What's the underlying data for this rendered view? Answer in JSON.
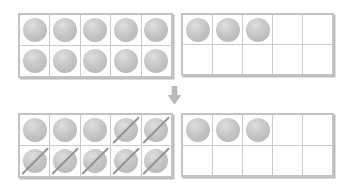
{
  "colors": {
    "background": "#ffffff",
    "frame_border": "#c3c3c3",
    "frame_shadow": "#bcbcbc",
    "grid_line": "#cbcbcb",
    "counter_main": "#c5c5c5",
    "counter_highlight": "#dedede",
    "counter_edge": "#b2b2b2",
    "slash": "#949494",
    "arrow": "#b9b9b9"
  },
  "arrow": {
    "icon": "down-block-arrow",
    "direction": "down"
  },
  "frames": [
    {
      "id": "top-left",
      "rows": 2,
      "cols": 5,
      "counter_count": 10,
      "filled_cells": [
        0,
        1,
        2,
        3,
        4,
        5,
        6,
        7,
        8,
        9
      ],
      "crossed_cells": [],
      "crossed_count": 0
    },
    {
      "id": "top-right",
      "rows": 2,
      "cols": 5,
      "counter_count": 3,
      "filled_cells": [
        0,
        1,
        2
      ],
      "crossed_cells": [],
      "crossed_count": 0
    },
    {
      "id": "bottom-left",
      "rows": 2,
      "cols": 5,
      "counter_count": 10,
      "filled_cells": [
        0,
        1,
        2,
        3,
        4,
        5,
        6,
        7,
        8,
        9
      ],
      "crossed_cells": [
        3,
        4,
        5,
        6,
        7,
        8,
        9
      ],
      "crossed_count": 7
    },
    {
      "id": "bottom-right",
      "rows": 2,
      "cols": 5,
      "counter_count": 3,
      "filled_cells": [
        0,
        1,
        2
      ],
      "crossed_cells": [],
      "crossed_count": 0
    }
  ]
}
